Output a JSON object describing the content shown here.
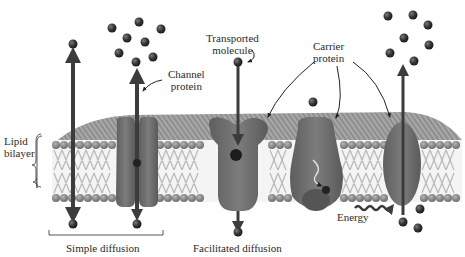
{
  "labels": {
    "transported_molecule": [
      "Transported",
      "molecule"
    ],
    "channel_protein": [
      "Channel",
      "protein"
    ],
    "carrier_protein": [
      "Carrier",
      "protein"
    ],
    "lipid_bilayer": [
      "Lipid",
      "bilayer"
    ],
    "energy": "Energy",
    "simple_diffusion": "Simple diffusion",
    "facilitated_diffusion": "Facilitated diffusion"
  },
  "colors": {
    "background": "#ffffff",
    "membrane_top": "#8a8a8a",
    "membrane_side": "#9a9a9a",
    "lipid_head": "#7d7d7d",
    "lipid_tail": "#e6e6e6",
    "protein": "#6e6e6e",
    "protein_dark": "#555555",
    "arrow": "#3c3c3c",
    "molecule": "#2e2e2e",
    "text": "#2a2a2a"
  },
  "components": [
    {
      "id": "simple-diffusion-arrow",
      "type": "arrow",
      "direction": "down-through-bilayer"
    },
    {
      "id": "channel-protein",
      "type": "protein",
      "mode": "simple diffusion via channel"
    },
    {
      "id": "carrier-protein-1",
      "type": "protein",
      "mode": "facilitated diffusion"
    },
    {
      "id": "carrier-protein-2",
      "type": "protein",
      "mode": "facilitated diffusion (conformational change)"
    },
    {
      "id": "carrier-protein-3",
      "type": "protein",
      "mode": "active transport (energy)"
    }
  ],
  "brackets": {
    "lipid_bilayer": "vertical left",
    "simple_diffusion": "horizontal bottom"
  }
}
